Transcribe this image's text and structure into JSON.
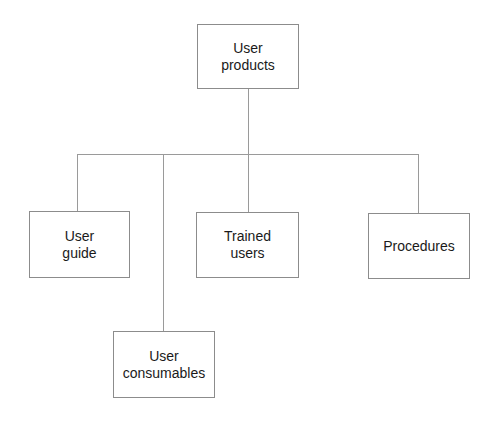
{
  "diagram": {
    "type": "hierarchy",
    "root": {
      "label": "User\nproducts"
    },
    "children": [
      {
        "label": "User\nguide"
      },
      {
        "label": "User\nconsumables"
      },
      {
        "label": "Trained\nusers"
      },
      {
        "label": "Procedures"
      }
    ],
    "colors": {
      "line": "#9a9a9a",
      "box_border": "#8c8c8c",
      "text": "#1a1a1a"
    }
  }
}
